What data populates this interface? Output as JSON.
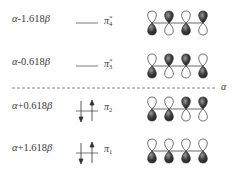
{
  "diagram": {
    "title": "",
    "reference_level_label": "α",
    "levels": [
      {
        "energy_prefix": "α",
        "energy_suffix": "-1.618",
        "energy_beta": "β",
        "orbital_symbol": "π",
        "orbital_index": "4",
        "orbital_star": "*",
        "electrons": 0,
        "top_lobes_dark": [
          false,
          true,
          false,
          true
        ]
      },
      {
        "energy_prefix": "α",
        "energy_suffix": "-0.618",
        "energy_beta": "β",
        "orbital_symbol": "π",
        "orbital_index": "3",
        "orbital_star": "*",
        "electrons": 0,
        "top_lobes_dark": [
          false,
          true,
          true,
          false
        ]
      },
      {
        "energy_prefix": "α",
        "energy_suffix": "+0.618",
        "energy_beta": "β",
        "orbital_symbol": "π",
        "orbital_index": "2",
        "orbital_star": "",
        "electrons": 2,
        "top_lobes_dark": [
          false,
          false,
          true,
          true
        ]
      },
      {
        "energy_prefix": "α",
        "energy_suffix": "+1.618",
        "energy_beta": "β",
        "orbital_symbol": "π",
        "orbital_index": "1",
        "orbital_star": "",
        "electrons": 2,
        "top_lobes_dark": [
          false,
          false,
          false,
          false
        ]
      }
    ],
    "colors": {
      "line": "#555555",
      "lobe_dark": "#2a2a2a",
      "lobe_light": "#ffffff",
      "text": "#3a3a3a"
    }
  }
}
